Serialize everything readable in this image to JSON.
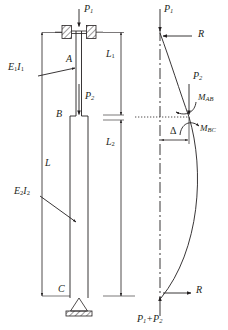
{
  "figure": {
    "type": "structural-engineering-diagram",
    "line_color": "#231f20",
    "background": "#ffffff"
  },
  "left_diagram": {
    "name": "stepped-column-elevation",
    "loads": {
      "top_load": "P",
      "top_load_sub": "1",
      "mid_load": "P",
      "mid_load_sub": "2"
    },
    "nodes": [
      {
        "id": "A",
        "label": "A",
        "position": "top-fixed-support"
      },
      {
        "id": "B",
        "label": "B",
        "position": "step-junction"
      },
      {
        "id": "C",
        "label": "C",
        "position": "bottom-pin-support"
      }
    ],
    "stiffness": [
      {
        "label": "E",
        "sub": "1",
        "label2": "I",
        "sub2": "1",
        "segment": "upper"
      },
      {
        "label": "E",
        "sub": "2",
        "label2": "I",
        "sub2": "2",
        "segment": "lower"
      }
    ],
    "dimensions": [
      {
        "name": "overall-length",
        "label": "L",
        "sub": ""
      },
      {
        "name": "upper-length",
        "label": "L",
        "sub": "1"
      },
      {
        "name": "lower-length",
        "label": "L",
        "sub": "2"
      }
    ]
  },
  "right_diagram": {
    "name": "free-body-buckled-shape",
    "forces": [
      {
        "name": "top-axial-load",
        "label": "P",
        "sub": "1",
        "direction": "down"
      },
      {
        "name": "top-reaction",
        "label": "R",
        "sub": "",
        "direction": "left"
      },
      {
        "name": "mid-axial-load",
        "label": "P",
        "sub": "2",
        "direction": "down"
      },
      {
        "name": "base-reaction",
        "label": "R",
        "sub": "",
        "direction": "right"
      },
      {
        "name": "base-axial-load",
        "label": "P",
        "sub": "1",
        "label_plus": "+P",
        "sub2": "2",
        "direction": "up"
      }
    ],
    "moments": [
      {
        "name": "moment-AB",
        "label": "M",
        "sub": "AB",
        "sense": "counterclockwise"
      },
      {
        "name": "moment-BC",
        "label": "M",
        "sub": "BC",
        "sense": "clockwise"
      }
    ],
    "deflection": {
      "name": "lateral-deflection",
      "label": "Δ"
    },
    "dimensions": [
      {
        "name": "upper-length",
        "label": "L",
        "sub": "1"
      },
      {
        "name": "lower-length",
        "label": "L",
        "sub": "2"
      }
    ]
  }
}
